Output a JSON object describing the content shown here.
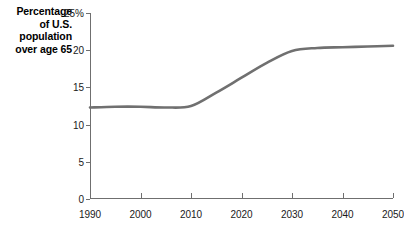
{
  "caption": {
    "lines": [
      "Percentage",
      "of U.S.",
      "population",
      "over age 65"
    ]
  },
  "chart_data": {
    "type": "line",
    "title": "Percentage of U.S. population over age 65",
    "xlabel": "",
    "ylabel": "Percentage of U.S. population over age 65",
    "xlim": [
      1990,
      2050
    ],
    "ylim": [
      0,
      25
    ],
    "grid": false,
    "legend": null,
    "line_color": "#707070",
    "axis_color": "#6f6f6f",
    "y_ticks": [
      0,
      5,
      10,
      15,
      20,
      25
    ],
    "y_tick_labels": [
      "0",
      "5",
      "10",
      "15",
      "20",
      "25%"
    ],
    "x_ticks": [
      1990,
      2000,
      2010,
      2020,
      2030,
      2040,
      2050
    ],
    "x_tick_labels": [
      "1990",
      "2000",
      "2010",
      "2020",
      "2030",
      "2040",
      "2050"
    ],
    "x": [
      1990,
      1995,
      2000,
      2005,
      2010,
      2015,
      2020,
      2025,
      2030,
      2035,
      2040,
      2045,
      2050
    ],
    "values": [
      12.3,
      12.4,
      12.4,
      12.3,
      12.5,
      14.3,
      16.3,
      18.3,
      19.9,
      20.3,
      20.4,
      20.5,
      20.6
    ],
    "series": [
      {
        "name": "Percentage of U.S. population over age 65",
        "values": [
          12.3,
          12.4,
          12.4,
          12.3,
          12.5,
          14.3,
          16.3,
          18.3,
          19.9,
          20.3,
          20.4,
          20.5,
          20.6
        ]
      }
    ]
  }
}
